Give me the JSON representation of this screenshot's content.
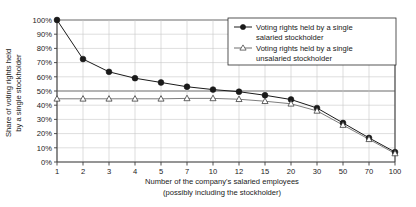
{
  "chart_data": {
    "type": "line",
    "title": "",
    "xlabel": "Number of the company's salaried employees (possibly including the stockholder)",
    "xlabel_line1": "Number of the company's salaried employees",
    "xlabel_line2": "(possibly including the stockholder)",
    "ylabel": "Share of voting rights held by a single stockholder",
    "ylabel_line1": "Share of voting rights held",
    "ylabel_line2": "by a single stockholder",
    "categories": [
      "1",
      "2",
      "3",
      "4",
      "5",
      "7",
      "10",
      "12",
      "15",
      "20",
      "30",
      "50",
      "70",
      "100"
    ],
    "ylim": [
      0,
      100
    ],
    "ytick_labels": [
      "0%",
      "10%",
      "20%",
      "30%",
      "40%",
      "50%",
      "60%",
      "70%",
      "80%",
      "90%",
      "100%"
    ],
    "ytick_values": [
      0,
      10,
      20,
      30,
      40,
      50,
      60,
      70,
      80,
      90,
      100
    ],
    "grid": true,
    "legend_position": "top-right",
    "series": [
      {
        "name": "Voting rights held by a single salaried stockholder",
        "name_line1": "Voting rights held by a single",
        "name_line2": "salaried stockholder",
        "marker": "filled-circle",
        "color": "#1a1a1a",
        "values": [
          100,
          72.5,
          63.5,
          59,
          56,
          53,
          51,
          49.5,
          47,
          44,
          38,
          27.5,
          17,
          7
        ]
      },
      {
        "name": "Voting rights held by a single unsalaried stockholder",
        "name_line1": "Voting rights held by a single",
        "name_line2": "unsalaried stockholder",
        "marker": "open-triangle",
        "color": "#6e6e6e",
        "values": [
          44.5,
          44.5,
          44.5,
          44.5,
          44.5,
          44.8,
          44.8,
          44.2,
          42.8,
          41,
          36,
          26,
          16,
          6
        ]
      }
    ]
  },
  "colors": {
    "axis": "#3d3d3d",
    "grid": "#c8c8c8",
    "emphasis_grid": "#6b6b6b",
    "series1": "#1a1a1a",
    "series2": "#6e6e6e",
    "text": "#1a1a1a",
    "legend_border": "#2b2b2b",
    "background": "#ffffff"
  }
}
